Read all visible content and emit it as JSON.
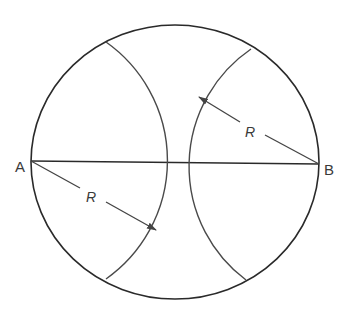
{
  "diagram": {
    "title": "",
    "points": {
      "A": {
        "label": "A",
        "x": 31,
        "y": 161
      },
      "B": {
        "label": "B",
        "x": 319,
        "y": 164
      }
    },
    "outer_circle": {
      "cx": 175,
      "cy": 162,
      "rx": 144,
      "ry": 137
    },
    "chord": {
      "from": "A",
      "to": "B"
    },
    "arcs": [
      {
        "name": "arc-centered-A",
        "center": "A",
        "radius_label": "R"
      },
      {
        "name": "arc-centered-B",
        "center": "B",
        "radius_label": "R"
      }
    ],
    "dimensions": [
      {
        "name": "radius-from-A",
        "label": "R",
        "from": "A",
        "arrowhead_at": "arc"
      },
      {
        "name": "radius-from-B",
        "label": "R",
        "from": "B",
        "arrowhead_at": "arc"
      }
    ],
    "colors": {
      "line": "#2a2a2a",
      "arc": "#4a4a4a",
      "text": "#3a3a3a",
      "background": "#ffffff"
    }
  }
}
